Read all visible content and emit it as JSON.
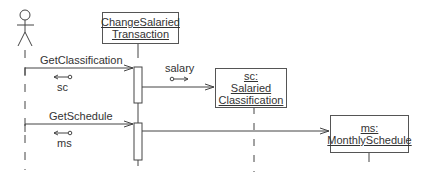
{
  "diagram": {
    "type": "uml-sequence",
    "actor": {
      "name": "actor"
    },
    "objects": [
      {
        "id": "cst",
        "lines": [
          "ChangeSalaried",
          "Transaction"
        ]
      },
      {
        "id": "sc",
        "lines": [
          "sc:",
          "Salaried",
          "Classification"
        ]
      },
      {
        "id": "ms",
        "lines": [
          "ms:",
          "MonthlySchedule"
        ]
      }
    ],
    "messages": [
      {
        "label": "GetClassification",
        "from": "actor",
        "to": "cst"
      },
      {
        "label": "GetSchedule",
        "from": "actor",
        "to": "cst"
      }
    ],
    "data_tokens": [
      {
        "label": "sc",
        "direction": "return"
      },
      {
        "label": "salary",
        "direction": "param"
      },
      {
        "label": "ms",
        "direction": "return"
      }
    ]
  }
}
